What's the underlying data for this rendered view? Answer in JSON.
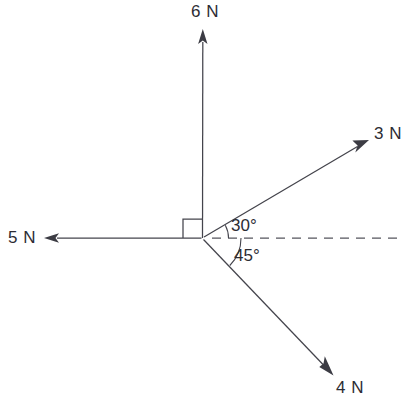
{
  "diagram": {
    "type": "free-body-force-diagram",
    "origin": {
      "x": 202,
      "y": 238
    },
    "stroke_color": "#44444c",
    "text_color": "#2c2c33",
    "background_color": "#ffffff",
    "reference_axis": {
      "name": "horizontal-dashed-reference",
      "style": "dashed",
      "from_x": 210,
      "to_x": 399,
      "y": 238
    },
    "right_angle_marker": {
      "label": "right-angle-between-5N-and-6N",
      "size": 19,
      "degrees": 90
    },
    "forces": [
      {
        "label": "6 N",
        "magnitude": 6,
        "unit": "N",
        "direction": "up",
        "angle_from_reference_deg": 90,
        "tip": {
          "x": 203,
          "y": 30
        }
      },
      {
        "label": "3 N",
        "magnitude": 3,
        "unit": "N",
        "direction": "up-right",
        "angle_from_reference_deg": 30,
        "tip": {
          "x": 368,
          "y": 140
        }
      },
      {
        "label": "5 N",
        "magnitude": 5,
        "unit": "N",
        "direction": "left",
        "angle_from_reference_deg": 180,
        "tip": {
          "x": 45,
          "y": 238
        }
      },
      {
        "label": "4 N",
        "magnitude": 4,
        "unit": "N",
        "direction": "down-right",
        "angle_from_reference_deg": -45,
        "tip": {
          "x": 333,
          "y": 375
        }
      }
    ],
    "angle_labels": [
      {
        "name": "angle-30",
        "text": "30°",
        "value": 30,
        "between": "3 N and horizontal reference"
      },
      {
        "name": "angle-45",
        "text": "45°",
        "value": 45,
        "between": "4 N and horizontal reference"
      }
    ]
  }
}
